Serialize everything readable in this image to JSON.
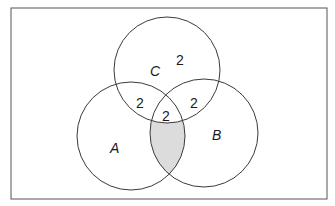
{
  "diagram": {
    "type": "venn-3",
    "sets": [
      {
        "id": "A",
        "label": "A"
      },
      {
        "id": "B",
        "label": "B"
      },
      {
        "id": "C",
        "label": "C"
      }
    ],
    "regions": [
      {
        "region": "C only",
        "value": "2"
      },
      {
        "region": "A∩C only",
        "value": "2"
      },
      {
        "region": "B∩C only",
        "value": "2"
      },
      {
        "region": "A∩B∩C",
        "value": "2"
      }
    ],
    "shaded_region": "A∩B only (not C)",
    "colors": {
      "stroke": "#3a3a3a",
      "shade": "#dcdcdc",
      "frame": "#555555"
    }
  }
}
